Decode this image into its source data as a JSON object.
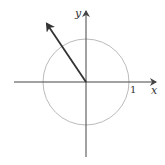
{
  "diagram": {
    "title": "",
    "axes": {
      "x_label": "x",
      "y_label": "y",
      "tick_label": "1"
    },
    "unit_circle": {
      "radius": 1,
      "color": "#bbbbbb"
    },
    "vector": {
      "color": "#333333",
      "from": [
        0,
        0
      ],
      "to_approx": [
        -0.93,
        1.37
      ],
      "direction": "second quadrant"
    },
    "colors": {
      "axes": "#444444",
      "text": "#333333",
      "background": "#ffffff"
    }
  }
}
